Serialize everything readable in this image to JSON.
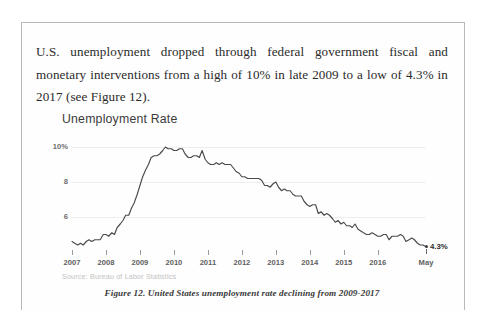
{
  "document": {
    "paragraph": "U.S. unemployment dropped through federal government fiscal and monetary interventions from a high of 10% in late 2009 to a low of 4.3% in 2017 (see Figure 12)."
  },
  "figure": {
    "caption": "Figure 12. United States unemployment rate declining from 2009-2017",
    "source_note": "Source: Bureau of Labor Statistics"
  },
  "colors": {
    "line": "#4a4a4a",
    "gridline": "#eeeeee",
    "frame": "#b9b9b9",
    "axis_text": "#5f5f5f",
    "body_text": "#2a2a2a",
    "source_text": "#c2c2c2"
  },
  "chart_data": {
    "type": "line",
    "title": "Unemployment Rate",
    "xlabel": "",
    "ylabel": "",
    "ylim": [
      4,
      10.4
    ],
    "xlim": [
      2007.0,
      2017.42
    ],
    "grid": true,
    "legend": null,
    "ytick_labels": [
      "10%",
      "8",
      "6"
    ],
    "ytick_values": [
      10,
      8,
      6
    ],
    "xtick_labels": [
      "2007",
      "2008",
      "2009",
      "2010",
      "2011",
      "2012",
      "2013",
      "2014",
      "2015",
      "2016",
      "May"
    ],
    "xtick_values": [
      2007,
      2008,
      2009,
      2010,
      2011,
      2012,
      2013,
      2014,
      2015,
      2016,
      2017.42
    ],
    "annotations": [
      {
        "label": "4.3%",
        "x": 2017.42,
        "y": 4.3
      }
    ],
    "series": [
      {
        "name": "U.S. unemployment rate",
        "units": "percent",
        "x": [
          2007.0,
          2007.08,
          2007.17,
          2007.25,
          2007.33,
          2007.42,
          2007.5,
          2007.58,
          2007.67,
          2007.75,
          2007.83,
          2007.92,
          2008.0,
          2008.08,
          2008.17,
          2008.25,
          2008.33,
          2008.42,
          2008.5,
          2008.58,
          2008.67,
          2008.75,
          2008.83,
          2008.92,
          2009.0,
          2009.08,
          2009.17,
          2009.25,
          2009.33,
          2009.42,
          2009.5,
          2009.58,
          2009.67,
          2009.75,
          2009.83,
          2009.92,
          2010.0,
          2010.08,
          2010.17,
          2010.25,
          2010.33,
          2010.42,
          2010.5,
          2010.58,
          2010.67,
          2010.75,
          2010.83,
          2010.92,
          2011.0,
          2011.08,
          2011.17,
          2011.25,
          2011.33,
          2011.42,
          2011.5,
          2011.58,
          2011.67,
          2011.75,
          2011.83,
          2011.92,
          2012.0,
          2012.08,
          2012.17,
          2012.25,
          2012.33,
          2012.42,
          2012.5,
          2012.58,
          2012.67,
          2012.75,
          2012.83,
          2012.92,
          2013.0,
          2013.08,
          2013.17,
          2013.25,
          2013.33,
          2013.42,
          2013.5,
          2013.58,
          2013.67,
          2013.75,
          2013.83,
          2013.92,
          2014.0,
          2014.08,
          2014.17,
          2014.25,
          2014.33,
          2014.42,
          2014.5,
          2014.58,
          2014.67,
          2014.75,
          2014.83,
          2014.92,
          2015.0,
          2015.08,
          2015.17,
          2015.25,
          2015.33,
          2015.42,
          2015.5,
          2015.58,
          2015.67,
          2015.75,
          2015.83,
          2015.92,
          2016.0,
          2016.08,
          2016.17,
          2016.25,
          2016.33,
          2016.42,
          2016.5,
          2016.58,
          2016.67,
          2016.75,
          2016.83,
          2016.92,
          2017.0,
          2017.08,
          2017.17,
          2017.25,
          2017.33,
          2017.42
        ],
        "y": [
          4.6,
          4.5,
          4.4,
          4.5,
          4.4,
          4.6,
          4.7,
          4.6,
          4.7,
          4.7,
          4.7,
          5.0,
          5.0,
          4.9,
          5.1,
          5.0,
          5.4,
          5.6,
          5.8,
          6.1,
          6.1,
          6.5,
          6.8,
          7.3,
          7.8,
          8.3,
          8.7,
          9.0,
          9.4,
          9.5,
          9.5,
          9.6,
          9.8,
          10.0,
          9.9,
          9.9,
          9.8,
          9.8,
          9.9,
          9.9,
          9.6,
          9.4,
          9.4,
          9.5,
          9.5,
          9.4,
          9.8,
          9.3,
          9.1,
          9.0,
          9.0,
          9.1,
          9.0,
          9.1,
          9.0,
          9.0,
          9.0,
          8.8,
          8.6,
          8.5,
          8.3,
          8.3,
          8.2,
          8.2,
          8.2,
          8.2,
          8.2,
          8.1,
          7.8,
          7.8,
          7.7,
          7.9,
          8.0,
          7.7,
          7.5,
          7.6,
          7.5,
          7.5,
          7.3,
          7.2,
          7.2,
          7.2,
          6.9,
          6.7,
          6.6,
          6.7,
          6.7,
          6.2,
          6.3,
          6.1,
          6.2,
          6.1,
          5.9,
          5.7,
          5.8,
          5.6,
          5.7,
          5.5,
          5.5,
          5.4,
          5.6,
          5.3,
          5.2,
          5.1,
          5.0,
          5.0,
          5.1,
          5.0,
          4.9,
          4.9,
          5.0,
          5.0,
          4.7,
          4.9,
          4.9,
          4.9,
          5.0,
          4.9,
          4.6,
          4.7,
          4.8,
          4.7,
          4.5,
          4.4,
          4.4,
          4.3
        ]
      }
    ]
  }
}
